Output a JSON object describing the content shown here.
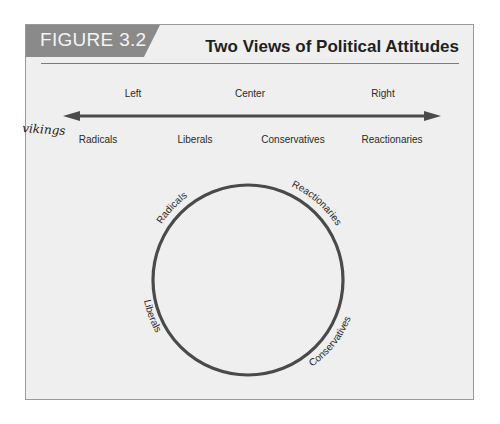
{
  "figure": {
    "number_label": "FIGURE 3.2",
    "title": "Two Views of Political Attitudes"
  },
  "linear_view": {
    "top_labels": [
      "Left",
      "Center",
      "Right"
    ],
    "bottom_labels": [
      "Radicals",
      "Liberals",
      "Conservatives",
      "Reactionaries"
    ],
    "arrow": "double-headed"
  },
  "circular_view": {
    "labels": {
      "top_left": "Radicals",
      "top_right": "Reactionaries",
      "bottom_left": "Liberals",
      "bottom_right": "Conservatives"
    }
  },
  "annotation": {
    "handwritten": "vikings"
  },
  "colors": {
    "background": "#efefef",
    "tab": "#8a8a8a",
    "line": "#444444",
    "text": "#2a2a2a"
  }
}
